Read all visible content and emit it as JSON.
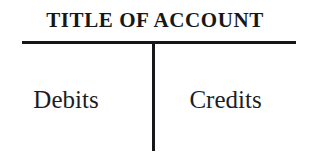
{
  "diagram": {
    "kind": "t-account",
    "title": "TITLE OF ACCOUNT",
    "left_column": {
      "label": "Debits"
    },
    "right_column": {
      "label": "Credits"
    },
    "colors": {
      "background": "#ffffff",
      "ink": "#15171a",
      "title_ink": "#171717",
      "label_ink": "#1d1d1f"
    }
  }
}
